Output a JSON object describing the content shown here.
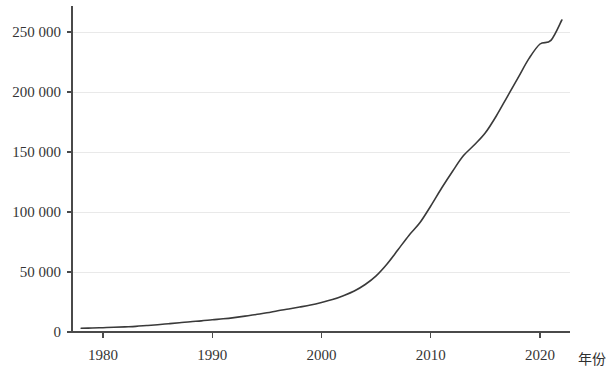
{
  "chart_data": {
    "type": "line",
    "title": "",
    "subtitle": "",
    "xlabel": "年份",
    "ylabel": "",
    "xlim": [
      1978,
      2023
    ],
    "ylim": [
      0,
      270000
    ],
    "grid": true,
    "legend": null,
    "x_ticks": [
      "1980",
      "1990",
      "2000",
      "2010",
      "2020"
    ],
    "x_tick_values": [
      1980,
      1990,
      2000,
      2010,
      2020
    ],
    "y_ticks": [
      "0",
      "50 000",
      "100 000",
      "150 000",
      "200 000",
      "250 000"
    ],
    "y_tick_values": [
      0,
      50000,
      100000,
      150000,
      200000,
      250000
    ],
    "line_color": "#3a3a3a",
    "grid_color": "#e9e9e9",
    "axis_color": "#4a4a4a",
    "series": [
      {
        "name": "",
        "x": [
          1978,
          1979,
          1980,
          1981,
          1982,
          1983,
          1984,
          1985,
          1986,
          1987,
          1988,
          1989,
          1990,
          1991,
          1992,
          1993,
          1994,
          1995,
          1996,
          1997,
          1998,
          1999,
          2000,
          2001,
          2002,
          2003,
          2004,
          2005,
          2006,
          2007,
          2008,
          2009,
          2010,
          2011,
          2012,
          2013,
          2014,
          2015,
          2016,
          2017,
          2018,
          2019,
          2020,
          2021,
          2022
        ],
        "values": [
          3100,
          3300,
          3600,
          3900,
          4300,
          4700,
          5400,
          6100,
          6900,
          7700,
          8600,
          9300,
          10200,
          11000,
          12000,
          13200,
          14600,
          16000,
          17700,
          19200,
          20800,
          22500,
          24600,
          27000,
          30300,
          34200,
          39600,
          46800,
          56700,
          68500,
          80500,
          91000,
          105000,
          120000,
          134000,
          147000,
          156000,
          166000,
          180000,
          196000,
          212000,
          228000,
          240000,
          243000,
          260000
        ]
      }
    ],
    "annotations": []
  },
  "axis": {
    "x_axis_title": "年份"
  }
}
